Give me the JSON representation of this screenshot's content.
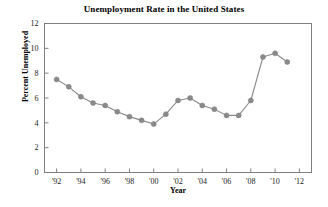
{
  "chart_data": {
    "type": "line",
    "title": "Unemployment Rate in the United States",
    "xlabel": "Year",
    "ylabel": "Percent Unemployed",
    "x": [
      1992,
      1993,
      1994,
      1995,
      1996,
      1997,
      1998,
      1999,
      2000,
      2001,
      2002,
      2003,
      2004,
      2005,
      2006,
      2007,
      2008,
      2009,
      2010,
      2011
    ],
    "values": [
      7.5,
      6.9,
      6.1,
      5.6,
      5.4,
      4.9,
      4.5,
      4.2,
      3.9,
      4.7,
      5.8,
      6.0,
      5.4,
      5.1,
      4.6,
      4.6,
      5.8,
      9.3,
      9.6,
      8.9
    ],
    "xlim": [
      1991,
      2013
    ],
    "ylim": [
      0,
      12
    ],
    "xticks": [
      1992,
      1994,
      1996,
      1998,
      2000,
      2002,
      2004,
      2006,
      2008,
      2010,
      2012
    ],
    "xtick_labels": [
      "'92",
      "'94",
      "'96",
      "'98",
      "'00",
      "'02",
      "'04",
      "'06",
      "'08",
      "'10",
      "'12"
    ],
    "yticks": [
      0,
      2,
      4,
      6,
      8,
      10,
      12
    ],
    "ytick_labels": [
      "0",
      "2",
      "4",
      "6",
      "8",
      "10",
      "12"
    ],
    "grid": false,
    "legend": null,
    "series_color": "#8a8a8a",
    "marker": "circle",
    "frame_color": "#808080"
  }
}
